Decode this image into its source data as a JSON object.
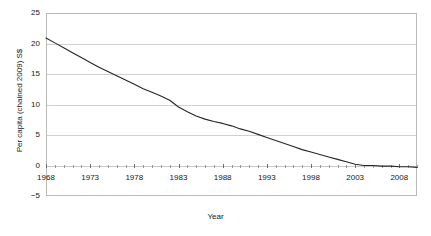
{
  "figure": {
    "top_cropped_text": "",
    "background_color": "#ffffff",
    "line_color": "#262626",
    "grid_color": "#d0d0d0",
    "frame_color": "#b9b9b9",
    "text_color": "#171717"
  },
  "axes": {
    "y_label": "Per capita (chained 2009) S$",
    "x_label": "Year",
    "y_ticks": [
      "25",
      "20",
      "15",
      "10",
      "5",
      "0",
      "-5"
    ],
    "x_ticks": [
      "1968",
      "1973",
      "1978",
      "1983",
      "1988",
      "1993",
      "1998",
      "2003",
      "2008"
    ]
  },
  "chart_data": {
    "type": "line",
    "title": "",
    "xlabel": "Year",
    "ylabel": "Per capita (chained 2009) S$",
    "xlim": [
      1968,
      2010
    ],
    "ylim": [
      -5,
      25
    ],
    "yticks": [
      -5,
      0,
      5,
      10,
      15,
      20,
      25
    ],
    "xticks": [
      1968,
      1973,
      1978,
      1983,
      1988,
      1993,
      1998,
      2003,
      2008
    ],
    "grid": true,
    "legend": null,
    "series": [
      {
        "name": "Per capita (chained 2009) S$",
        "color": "#262626",
        "x": [
          1968,
          1969,
          1970,
          1971,
          1972,
          1973,
          1974,
          1975,
          1976,
          1977,
          1978,
          1979,
          1980,
          1981,
          1982,
          1983,
          1984,
          1985,
          1986,
          1987,
          1988,
          1989,
          1990,
          1991,
          1992,
          1993,
          1994,
          1995,
          1996,
          1997,
          1998,
          1999,
          2000,
          2001,
          2002,
          2003,
          2004,
          2005,
          2006,
          2007,
          2008,
          2009,
          2010
        ],
        "values": [
          20.9,
          20.1,
          19.3,
          18.5,
          17.7,
          16.9,
          16.1,
          15.4,
          14.7,
          14.0,
          13.3,
          12.6,
          12.0,
          11.4,
          10.7,
          9.6,
          8.8,
          8.1,
          7.6,
          7.2,
          6.9,
          6.5,
          6.0,
          5.6,
          5.1,
          4.6,
          4.1,
          3.6,
          3.1,
          2.6,
          2.2,
          1.8,
          1.4,
          1.0,
          0.6,
          0.2,
          0.0,
          0.0,
          -0.1,
          -0.1,
          -0.2,
          -0.2,
          -0.3
        ]
      }
    ]
  }
}
